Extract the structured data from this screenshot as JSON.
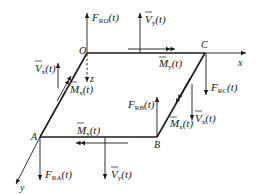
{
  "figure": {
    "points": {
      "O": "O",
      "A": "A",
      "B": "B",
      "C": "C"
    },
    "axes": {
      "x": "x",
      "y": "y",
      "z": "z"
    },
    "labels": {
      "F_RO": {
        "main": "F",
        "sub": "RO",
        "arg": "(t)"
      },
      "F_RA": {
        "main": "F",
        "sub": "RA",
        "arg": "(t)"
      },
      "F_RB": {
        "main": "F",
        "sub": "RB",
        "arg": "(t)"
      },
      "F_RC": {
        "main": "F",
        "sub": "RC",
        "arg": "(t)"
      },
      "V_y_top": {
        "main": "V",
        "sub": "y",
        "arg": "(t)"
      },
      "V_y_bottom": {
        "main": "V",
        "sub": "y",
        "arg": "(t)"
      },
      "V_x_left": {
        "main": "V",
        "sub": "x",
        "arg": "(t)"
      },
      "V_x_right": {
        "main": "V",
        "sub": "x",
        "arg": "(t)"
      },
      "M_y_top": {
        "main": "M",
        "sub": "y",
        "arg": "(t)"
      },
      "M_y_bottom": {
        "main": "M",
        "sub": "y",
        "arg": "(t)"
      },
      "M_x_left": {
        "main": "M",
        "sub": "x",
        "arg": "(t)"
      },
      "M_x_right": {
        "main": "M",
        "sub": "x",
        "arg": "(t)"
      }
    },
    "colors": {
      "ink": "#1a1a1a",
      "background": "#ffffff"
    }
  }
}
